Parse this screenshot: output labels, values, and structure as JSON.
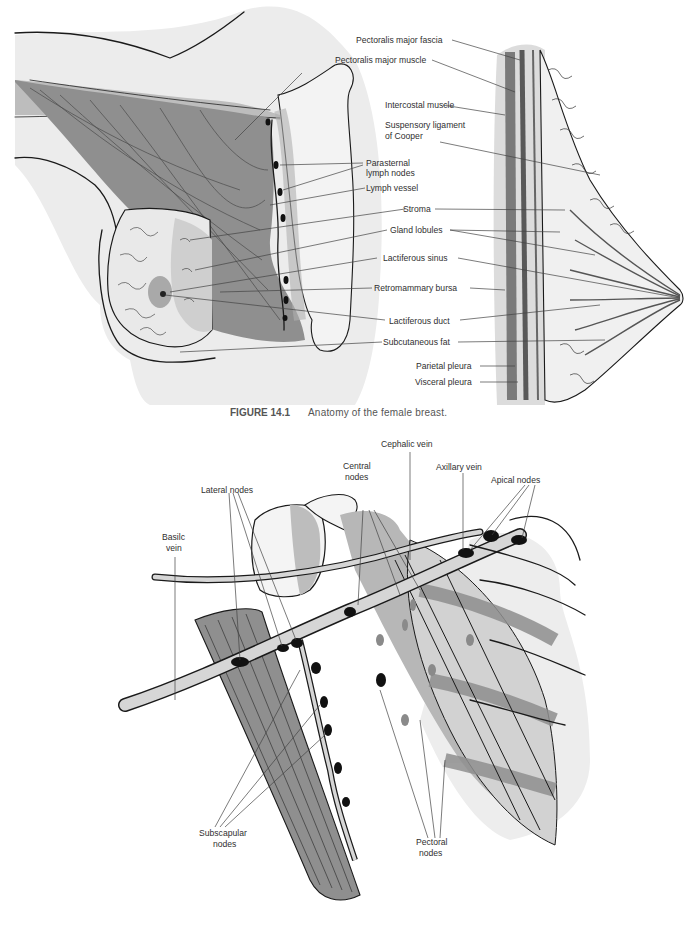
{
  "figure_14_1": {
    "caption_number": "FIGURE 14.1",
    "caption_text": "Anatomy of the female breast.",
    "labels": {
      "pectoralis_major_fascia": "Pectoralis major fascia",
      "pectoralis_major_muscle": "Pectoralis major muscle",
      "intercostal_muscle": "Intercostal muscle",
      "suspensory_ligament_1": "Suspensory ligament",
      "suspensory_ligament_2": "of Cooper",
      "parasternal_1": "Parasternal",
      "parasternal_2": "lymph nodes",
      "lymph_vessel": "Lymph vessel",
      "stroma": "Stroma",
      "gland_lobules": "Gland lobules",
      "lactiferous_sinus": "Lactiferous sinus",
      "retromammary_bursa": "Retromammary bursa",
      "lactiferous_duct": "Lactiferous duct",
      "subcutaneous_fat": "Subcutaneous fat",
      "parietal_pleura": "Parietal pleura",
      "visceral_pleura": "Visceral pleura"
    }
  },
  "figure_14_2": {
    "labels": {
      "cephalic_vein": "Cephalic vein",
      "central_nodes_1": "Central",
      "central_nodes_2": "nodes",
      "axillary_vein": "Axillary vein",
      "apical_nodes": "Apical nodes",
      "lateral_nodes": "Lateral nodes",
      "basilic_vein_1": "Basilc",
      "basilic_vein_2": "vein",
      "subscapular_nodes_1": "Subscapular",
      "subscapular_nodes_2": "nodes",
      "pectoral_nodes_1": "Pectoral",
      "pectoral_nodes_2": "nodes"
    }
  },
  "colors": {
    "background": "#ffffff",
    "light_tissue": "#e6e6e6",
    "skin_gray": "#ececec",
    "muscle_gray": "#8f8f8f",
    "mid_gray": "#b3b3b3",
    "ink": "#1a1a1a",
    "node_black": "#111111"
  }
}
